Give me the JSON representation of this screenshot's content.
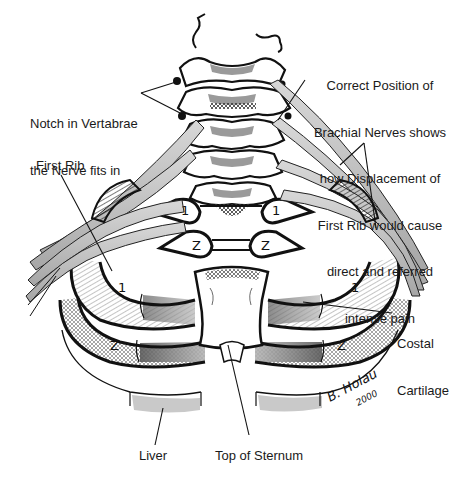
{
  "figure": {
    "colors": {
      "ink": "#111111",
      "nerve_fill": "#b8b8b8",
      "nerve_light": "#d6d6d6",
      "cartilage_shade": "#9a9a9a",
      "liver_fill": "#c9c9c9",
      "background": "#ffffff"
    }
  },
  "labels": {
    "notch": {
      "line1": "Notch in Vertabrae",
      "line2": "the Nerve fits in"
    },
    "brachial": {
      "line1": "Correct Position of",
      "line2": "Brachial Nerves shows",
      "line3": "how Displacement of",
      "line4": "First Rib would cause",
      "line5": "direct and referred",
      "line6": "intense pain"
    },
    "first_rib": "First Rib",
    "costal": {
      "line1": "Costal",
      "line2": "Cartilage"
    },
    "liver": "Liver",
    "sternum": "Top of Sternum"
  },
  "rib_numbers": {
    "rib1": "1",
    "rib2": "Z"
  },
  "signature": {
    "name": "B. Holau",
    "year": "2000"
  }
}
